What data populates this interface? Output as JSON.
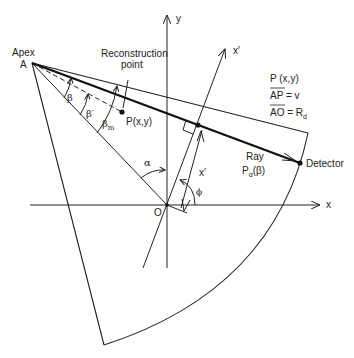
{
  "diagram": {
    "apex_label_1": "Apex",
    "apex_label_2": "A",
    "reconstruction_label_1": "Reconstruction",
    "reconstruction_label_2": "point",
    "point_label": "P(x,y)",
    "origin_label": "O",
    "x_axis_label": "x",
    "y_axis_label": "y",
    "x_prime_axis_label": "x′",
    "x_prime_distance_label": "x′",
    "beta_label": "β",
    "beta_prime_label": "β′",
    "beta_m_label": "β",
    "beta_m_sub": "m",
    "alpha_label": "α",
    "phi_label": "ϕ",
    "ray_label_1": "Ray",
    "ray_label_2_main": "P",
    "ray_label_2_sub": "α",
    "ray_label_2_arg": "(β)",
    "detector_label": "Detector",
    "legend": {
      "line1": "P (x,y)",
      "line2_over": "AP",
      "line2_rest": " = v",
      "line3_over": "AO",
      "line3_rest": " = R",
      "line3_sub": "d"
    },
    "stroke_color": "#222222"
  }
}
